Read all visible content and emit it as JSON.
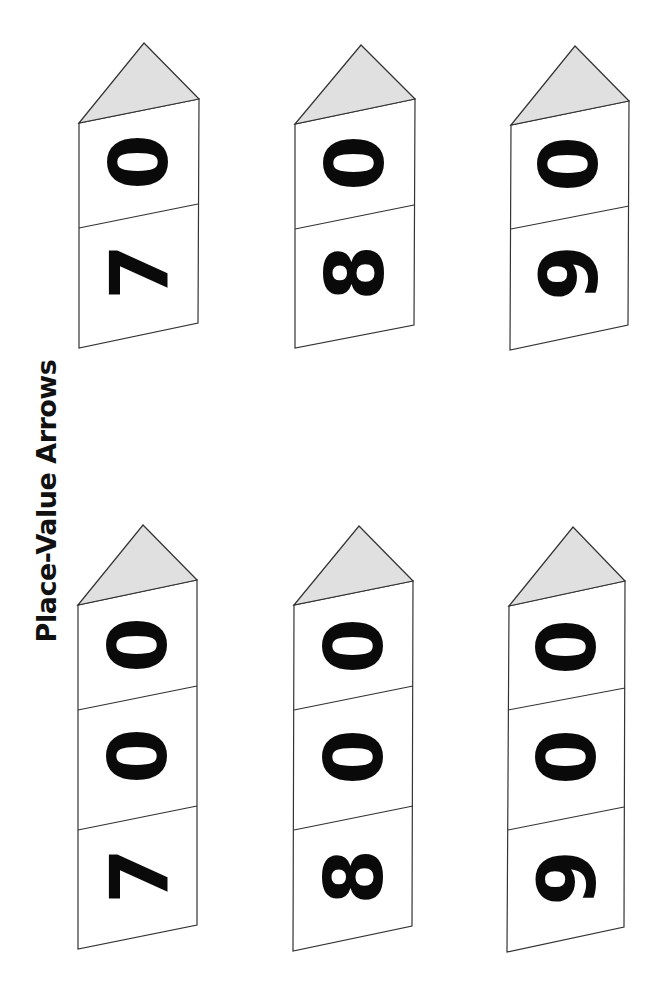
{
  "title": "Place-Value Arrows",
  "colors": {
    "arrow_head_fill": "#e0e0e0",
    "outline": "#333333",
    "digit": "#0a0a0a"
  },
  "arrows": [
    {
      "value": "70",
      "cells": [
        "0",
        "7"
      ],
      "row": "top",
      "column": 1
    },
    {
      "value": "80",
      "cells": [
        "0",
        "8"
      ],
      "row": "top",
      "column": 2
    },
    {
      "value": "90",
      "cells": [
        "0",
        "9"
      ],
      "row": "top",
      "column": 3
    },
    {
      "value": "700",
      "cells": [
        "0",
        "0",
        "7"
      ],
      "row": "bottom",
      "column": 1
    },
    {
      "value": "800",
      "cells": [
        "0",
        "0",
        "8"
      ],
      "row": "bottom",
      "column": 2
    },
    {
      "value": "900",
      "cells": [
        "0",
        "0",
        "9"
      ],
      "row": "bottom",
      "column": 3
    }
  ]
}
